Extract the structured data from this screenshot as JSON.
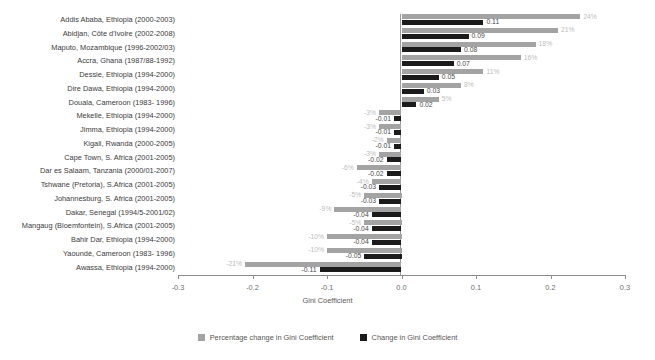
{
  "chart_data": {
    "type": "bar",
    "title": "",
    "xlabel": "Gini Coefficient",
    "ylabel": "",
    "xlim": [
      -0.3,
      0.3
    ],
    "xticks": [
      "-0.3",
      "-0.2",
      "-0.1",
      "0.0",
      "0.1",
      "0.2",
      "0.3"
    ],
    "xtick_values": [
      -0.3,
      -0.2,
      -0.1,
      0.0,
      0.1,
      0.2,
      0.3
    ],
    "grid": false,
    "orientation": "horizontal",
    "legend_position": "bottom",
    "categories": [
      "Addis Ababa, Ethiopia (2000-2003)",
      "Abidjan, Côte d'Ivoire (2002-2008)",
      "Maputo, Mozambique (1996-2002/03)",
      "Accra, Ghana (1987/88-1992)",
      "Dessie, Ethiopia (1994-2000)",
      "Dire Dawa, Ethiopia (1994-2000)",
      "Douala, Cameroon (1983- 1996)",
      "Mekelle, Ethiopia (1994-2000)",
      "Jimma, Ethiopia (1994-2000)",
      "Kigali, Rwanda (2000-2005)",
      "Cape Town, S. Africa (2001-2005)",
      "Dar es Salaam, Tanzania (2000/01-2007)",
      "Tshwane (Pretoria), S.Africa (2001-2005)",
      "Johannesburg, S. Africa (2001-2005)",
      "Dakar, Senegal (1994/5-2001/02)",
      "Mangaug (Bloemfontein), S.Africa (2001-2005)",
      "Bahir Dar, Ethiopia (1994-2000)",
      "Yaoundé, Cameroon (1983- 1996)",
      "Awassa, Ethiopia (1994-2000)"
    ],
    "series": [
      {
        "name": "Percentage change in Gini Coefficient",
        "color": "#a3a3a3",
        "values": [
          24,
          21,
          18,
          16,
          11,
          8,
          5,
          -3,
          -3,
          -2,
          -3,
          -6,
          -4,
          -5,
          -9,
          -5,
          -10,
          -10,
          -21
        ],
        "labels": [
          "24%",
          "21%",
          "18%",
          "16%",
          "11%",
          "8%",
          "5%",
          "-3%",
          "-3%",
          "-2%",
          "-3%",
          "-6%",
          "-4%",
          "-5%",
          "-9%",
          "-5%",
          "-10%",
          "-10%",
          "-21%"
        ]
      },
      {
        "name": "Change in Gini Coefficient",
        "color": "#1b1b1b",
        "values": [
          0.11,
          0.09,
          0.08,
          0.07,
          0.05,
          0.03,
          0.02,
          -0.01,
          -0.01,
          -0.01,
          -0.02,
          -0.02,
          -0.03,
          -0.03,
          -0.04,
          -0.04,
          -0.04,
          -0.05,
          -0.11
        ],
        "labels": [
          "0.11",
          "0.09",
          "0.08",
          "0.07",
          "0.05",
          "0.03",
          "0.02",
          "-0.01",
          "-0.01",
          "-0.01",
          "-0.02",
          "-0.02",
          "-0.03",
          "-0.03",
          "-0.04",
          "-0.04",
          "-0.04",
          "-0.05",
          "-0.11"
        ]
      }
    ]
  },
  "legend": {
    "items": [
      {
        "label": "Percentage change in Gini Coefficient",
        "swatch": "pct"
      },
      {
        "label": "Change in Gini Coefficient",
        "swatch": "gini"
      }
    ]
  },
  "axis": {
    "title": "Gini Coefficient"
  }
}
